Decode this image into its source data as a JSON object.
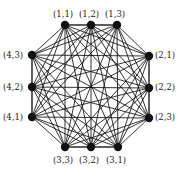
{
  "figure": {
    "name": "complete-graph-k12",
    "width": 181,
    "height": 174,
    "background_color": "#ffffff",
    "edge_color": "#111111",
    "node_color": "#111111",
    "label_color": "#1a1a1a"
  },
  "chart_data": {
    "type": "diagram",
    "graph_type": "complete-graph",
    "vertex_count": 12,
    "edge_count": 66,
    "title": "",
    "vertices": [
      {
        "id": "v1",
        "label": "(1,1)",
        "side": "top",
        "node_x": 65,
        "node_y": 25,
        "label_x": 53,
        "label_y": 10
      },
      {
        "id": "v2",
        "label": "(1,2)",
        "side": "top",
        "node_x": 91,
        "node_y": 25,
        "label_x": 79,
        "label_y": 10
      },
      {
        "id": "v3",
        "label": "(1,3)",
        "side": "top",
        "node_x": 117,
        "node_y": 25,
        "label_x": 105,
        "label_y": 10
      },
      {
        "id": "v4",
        "label": "(2,1)",
        "side": "right",
        "node_x": 149,
        "node_y": 56,
        "label_x": 155,
        "label_y": 51
      },
      {
        "id": "v5",
        "label": "(2,2)",
        "side": "right",
        "node_x": 149,
        "node_y": 88,
        "label_x": 155,
        "label_y": 83
      },
      {
        "id": "v6",
        "label": "(2,3)",
        "side": "right",
        "node_x": 149,
        "node_y": 118,
        "label_x": 155,
        "label_y": 113
      },
      {
        "id": "v7",
        "label": "(3,1)",
        "side": "bottom",
        "node_x": 118,
        "node_y": 147,
        "label_x": 106,
        "label_y": 156
      },
      {
        "id": "v8",
        "label": "(3,2)",
        "side": "bottom",
        "node_x": 91,
        "node_y": 147,
        "label_x": 79,
        "label_y": 156
      },
      {
        "id": "v9",
        "label": "(3,3)",
        "side": "bottom",
        "node_x": 65,
        "node_y": 147,
        "label_x": 53,
        "label_y": 156
      },
      {
        "id": "v10",
        "label": "(4,1)",
        "side": "left",
        "node_x": 32,
        "node_y": 117,
        "label_x": 3,
        "label_y": 113
      },
      {
        "id": "v11",
        "label": "(4,2)",
        "side": "left",
        "node_x": 32,
        "node_y": 87,
        "label_x": 3,
        "label_y": 83
      },
      {
        "id": "v12",
        "label": "(4,3)",
        "side": "left",
        "node_x": 32,
        "node_y": 55,
        "label_x": 3,
        "label_y": 51
      }
    ],
    "node_radius": 4.2,
    "edge_width": 0.85
  }
}
